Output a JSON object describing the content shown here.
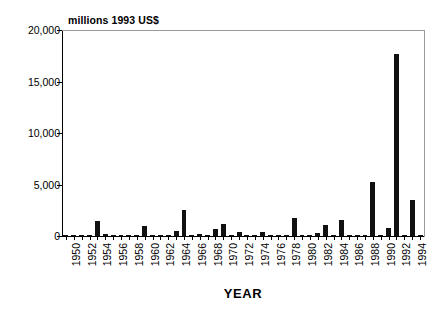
{
  "chart_data": {
    "type": "bar",
    "title": "millions 1993 US$",
    "xlabel": "YEAR",
    "ylabel": "",
    "ylim": [
      0,
      20000
    ],
    "yticks": [
      0,
      5000,
      10000,
      15000,
      20000
    ],
    "ytick_labels": [
      "0",
      "5,000",
      "10,000",
      "15,000",
      "20,000"
    ],
    "grid": false,
    "legend": null,
    "xtick_labels": [
      "1950",
      "1952",
      "1954",
      "1956",
      "1958",
      "1960",
      "1962",
      "1964",
      "1966",
      "1968",
      "1970",
      "1972",
      "1974",
      "1976",
      "1978",
      "1980",
      "1982",
      "1984",
      "1986",
      "1988",
      "1990",
      "1992",
      "1994"
    ],
    "xtick_step": 2,
    "categories": [
      "1950",
      "1951",
      "1952",
      "1953",
      "1954",
      "1955",
      "1956",
      "1957",
      "1958",
      "1959",
      "1960",
      "1961",
      "1962",
      "1963",
      "1964",
      "1965",
      "1966",
      "1967",
      "1968",
      "1969",
      "1970",
      "1971",
      "1972",
      "1973",
      "1974",
      "1975",
      "1976",
      "1977",
      "1978",
      "1979",
      "1980",
      "1981",
      "1982",
      "1983",
      "1984",
      "1985",
      "1986",
      "1987",
      "1988",
      "1989",
      "1990",
      "1991",
      "1992",
      "1993",
      "1994",
      "1995"
    ],
    "values": [
      60,
      30,
      40,
      50,
      1500,
      180,
      40,
      50,
      120,
      60,
      950,
      40,
      30,
      40,
      500,
      2500,
      60,
      180,
      60,
      650,
      1150,
      60,
      400,
      40,
      30,
      350,
      90,
      40,
      50,
      1750,
      110,
      50,
      250,
      1050,
      90,
      1600,
      40,
      30,
      60,
      5250,
      100,
      800,
      17700,
      90,
      3500,
      60
    ],
    "bar_color": "#111111",
    "axis_color": "#000000",
    "background_color": "#ffffff"
  }
}
